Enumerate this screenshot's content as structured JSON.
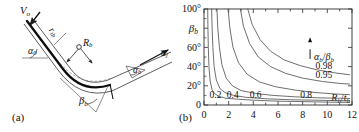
{
  "figure": {
    "panels": [
      {
        "tag": "(a)",
        "kind": "schematic",
        "description": "Bend forming schematic with incoming velocity, bend radius and bend angles",
        "labels": [
          {
            "name": "velocity-label",
            "base": "V",
            "sub": "o",
            "x": 22,
            "y": 8
          },
          {
            "name": "thickness-label",
            "base": "r",
            "sub": "tb",
            "x": 56,
            "y": 28
          },
          {
            "name": "bend-radius-label",
            "base": "R",
            "sub": "b",
            "x": 84,
            "y": 40
          },
          {
            "name": "alpha-zero-label",
            "base": "α",
            "sub": "0",
            "x": 30,
            "y": 50
          },
          {
            "name": "alpha-b-label",
            "base": "α",
            "sub": "b",
            "x": 134,
            "y": 68
          },
          {
            "name": "v-j-label",
            "base": "α",
            "sub": "j",
            "x": 163,
            "y": 53
          },
          {
            "name": "beta-b-label",
            "base": "β",
            "sub": "b",
            "x": 80,
            "y": 98
          }
        ]
      },
      {
        "tag": "(b)",
        "kind": "chart"
      }
    ]
  },
  "chart_data": {
    "type": "line",
    "title": "",
    "xlabel": "Rb/tb",
    "xlabel_parts": {
      "num_base": "R",
      "num_sub": "b",
      "den_base": "t",
      "den_sub": "b"
    },
    "ylabel": "βb",
    "ylabel_parts": {
      "base": "β",
      "sub": "b"
    },
    "legend_title": "αb/βb",
    "legend_title_parts": {
      "num_base": "α",
      "num_sub": "b",
      "den_base": "β",
      "den_sub": "b"
    },
    "legend_position": "inside-right",
    "legend_arrow": "up",
    "grid": false,
    "xlim": [
      0,
      12
    ],
    "ylim": [
      0,
      100
    ],
    "xticks": [
      0,
      2,
      4,
      6,
      8,
      10,
      12
    ],
    "xtick_labels": [
      "0",
      "2",
      "4",
      "6",
      "8",
      "10",
      "12"
    ],
    "xminor_step": 1,
    "yticks": [
      0,
      20,
      40,
      60,
      80,
      100
    ],
    "ytick_labels": [
      "0",
      "20°",
      "40°",
      "60°",
      "80°",
      "100°"
    ],
    "ytick_labels_shown": [
      "0",
      "20°",
      "40°",
      "60°",
      "100°"
    ],
    "series": [
      {
        "name": "0.2",
        "label": "0.2",
        "label_x": 0.45,
        "label_y": 7,
        "points": [
          [
            0.3,
            100
          ],
          [
            0.32,
            80
          ],
          [
            0.35,
            60
          ],
          [
            0.4,
            40
          ],
          [
            0.5,
            25
          ],
          [
            0.65,
            16
          ],
          [
            0.85,
            12
          ],
          [
            1.2,
            9
          ],
          [
            1.8,
            7
          ],
          [
            2.8,
            6
          ],
          [
            4.0,
            5
          ],
          [
            6.0,
            4
          ],
          [
            8.0,
            3.5
          ],
          [
            10.0,
            3
          ],
          [
            11.8,
            2.8
          ]
        ]
      },
      {
        "name": "0.4",
        "label": "0.4",
        "label_x": 1.85,
        "label_y": 7,
        "points": [
          [
            0.62,
            100
          ],
          [
            0.66,
            80
          ],
          [
            0.72,
            60
          ],
          [
            0.82,
            40
          ],
          [
            1.0,
            26
          ],
          [
            1.3,
            17
          ],
          [
            1.7,
            13
          ],
          [
            2.4,
            10
          ],
          [
            3.4,
            8
          ],
          [
            5.0,
            6.5
          ],
          [
            7.0,
            5.5
          ],
          [
            9.0,
            5
          ],
          [
            11.0,
            4.5
          ],
          [
            11.8,
            4.4
          ]
        ]
      },
      {
        "name": "0.6",
        "label": "0.6",
        "label_x": 3.7,
        "label_y": 7,
        "points": [
          [
            1.05,
            100
          ],
          [
            1.12,
            80
          ],
          [
            1.25,
            60
          ],
          [
            1.45,
            42
          ],
          [
            1.8,
            28
          ],
          [
            2.3,
            20
          ],
          [
            3.0,
            15
          ],
          [
            4.2,
            12
          ],
          [
            5.6,
            10
          ],
          [
            7.4,
            8.5
          ],
          [
            9.2,
            7.5
          ],
          [
            11.0,
            7
          ],
          [
            11.8,
            6.8
          ]
        ]
      },
      {
        "name": "0.8",
        "label": "0.8",
        "label_x": 7.8,
        "label_y": 7,
        "points": [
          [
            1.95,
            100
          ],
          [
            2.1,
            80
          ],
          [
            2.35,
            60
          ],
          [
            2.8,
            44
          ],
          [
            3.5,
            32
          ],
          [
            4.5,
            24
          ],
          [
            5.8,
            19
          ],
          [
            7.4,
            15.5
          ],
          [
            9.0,
            13
          ],
          [
            10.6,
            11.5
          ],
          [
            11.8,
            10.8
          ]
        ]
      },
      {
        "name": "0.95",
        "label": "0.95",
        "label_x": 9.05,
        "label_y": 28,
        "points": [
          [
            2.95,
            100
          ],
          [
            3.2,
            82
          ],
          [
            3.7,
            64
          ],
          [
            4.4,
            50
          ],
          [
            5.4,
            40
          ],
          [
            6.6,
            33
          ],
          [
            8.0,
            28
          ],
          [
            9.6,
            24.5
          ],
          [
            11.0,
            22.5
          ],
          [
            11.8,
            21.8
          ]
        ]
      },
      {
        "name": "0.98",
        "label": "0.98",
        "label_x": 9.05,
        "label_y": 38,
        "points": [
          [
            3.55,
            100
          ],
          [
            3.9,
            84
          ],
          [
            4.55,
            68
          ],
          [
            5.4,
            56
          ],
          [
            6.5,
            47
          ],
          [
            7.8,
            41
          ],
          [
            9.2,
            36.5
          ],
          [
            10.6,
            33.5
          ],
          [
            11.8,
            31.5
          ]
        ]
      }
    ]
  }
}
